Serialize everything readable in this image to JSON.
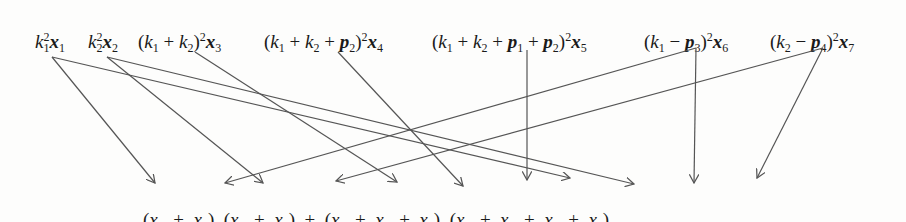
{
  "diagram": {
    "top_terms": [
      {
        "id": "t1",
        "label": "k1^2 x1",
        "x": 35,
        "var": "x1"
      },
      {
        "id": "t2",
        "label": "k2^2 x2",
        "x": 88,
        "var": "x2"
      },
      {
        "id": "t3",
        "label": "(k1 + k2)^2 x3",
        "x": 138,
        "var": "x3"
      },
      {
        "id": "t4",
        "label": "(k1 + k2 + p2)^2 x4",
        "x": 262,
        "var": "x4"
      },
      {
        "id": "t5",
        "label": "(k1 + k2 + p1 + p2)^2 x5",
        "x": 432,
        "var": "x5"
      },
      {
        "id": "t6",
        "label": "(k1 - p3)^2 x6",
        "x": 643,
        "var": "x6"
      },
      {
        "id": "t7",
        "label": "(k2 - p4)^2 x7",
        "x": 768,
        "var": "x7"
      }
    ],
    "bottom_expression": "(x1 + x6) (x2 + x7) + (x3 + x4 + x5) (x1 + x2 + x6 + x7)",
    "bottom_groups": [
      {
        "terms": [
          "x1",
          "x6"
        ]
      },
      {
        "terms": [
          "x2",
          "x7"
        ]
      },
      {
        "terms": [
          "x3",
          "x4",
          "x5"
        ]
      },
      {
        "terms": [
          "x1",
          "x2",
          "x6",
          "x7"
        ]
      }
    ],
    "connections": [
      {
        "from": "x1",
        "to": "group1.x1"
      },
      {
        "from": "x1",
        "to": "group4.x1"
      },
      {
        "from": "x2",
        "to": "group2.x2"
      },
      {
        "from": "x2",
        "to": "group4.x2"
      },
      {
        "from": "x3",
        "to": "group3.x3"
      },
      {
        "from": "x4",
        "to": "group3.x4"
      },
      {
        "from": "x5",
        "to": "group3.x5"
      },
      {
        "from": "x6",
        "to": "group1.x6"
      },
      {
        "from": "x6",
        "to": "group4.x6"
      },
      {
        "from": "x7",
        "to": "group2.x7"
      },
      {
        "from": "x7",
        "to": "group4.x7"
      }
    ],
    "text": {
      "k": "k",
      "p": "p",
      "x": "x",
      "plus": "+",
      "minus": "−",
      "lp": "(",
      "rp": ")",
      "sq": "2",
      "s1": "1",
      "s2": "2",
      "s3": "3",
      "s4": "4",
      "s5": "5",
      "s6": "6",
      "s7": "7"
    },
    "line_color": "#555555"
  }
}
